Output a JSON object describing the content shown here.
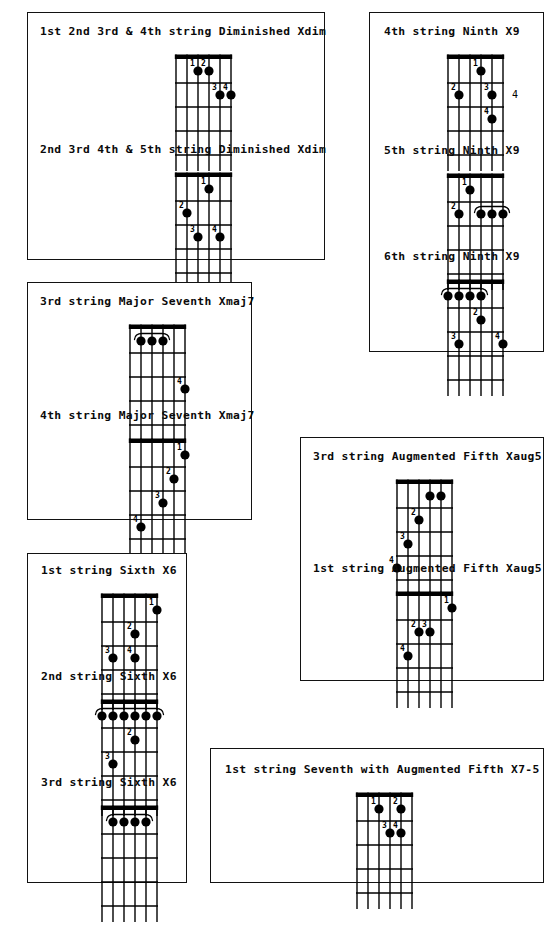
{
  "document": {
    "kind": "guitar-chord-diagram-sheet",
    "background_color": "#ffffff",
    "ink_color": "#000000"
  },
  "legend": {
    "finger_numbers": [
      "1",
      "2",
      "3",
      "4"
    ],
    "fret_marker_label": "4",
    "strings": 6,
    "frets": 5
  },
  "panels": [
    {
      "id": "panel-diminished",
      "x": 27,
      "y": 12,
      "w": 298,
      "h": 248,
      "chords": [
        {
          "id": "chord-dim-1234",
          "title": "1st 2nd 3rd & 4th string Diminished Xdim",
          "title_x": 12,
          "title_y": 12,
          "board_x": 132,
          "board_y": 34,
          "dots": [
            {
              "string": 4,
              "fret": 1,
              "finger": "1"
            },
            {
              "string": 3,
              "fret": 1,
              "finger": "2"
            },
            {
              "string": 2,
              "fret": 2,
              "finger": "3"
            },
            {
              "string": 1,
              "fret": 2,
              "finger": "4"
            }
          ],
          "barres": [],
          "fret_label": ""
        },
        {
          "id": "chord-dim-2345",
          "title": "2nd 3rd 4th & 5th string Diminished Xdim",
          "title_x": 12,
          "title_y": 130,
          "board_x": 132,
          "board_y": 152,
          "dots": [
            {
              "string": 3,
              "fret": 1,
              "finger": "1"
            },
            {
              "string": 5,
              "fret": 2,
              "finger": "2"
            },
            {
              "string": 4,
              "fret": 3,
              "finger": "3"
            },
            {
              "string": 2,
              "fret": 3,
              "finger": "4"
            }
          ],
          "barres": [],
          "fret_label": ""
        }
      ]
    },
    {
      "id": "panel-ninth",
      "x": 369,
      "y": 12,
      "w": 175,
      "h": 340,
      "chords": [
        {
          "id": "chord-ninth-4th",
          "title": "4th string Ninth X9",
          "title_x": 14,
          "title_y": 12,
          "board_x": 62,
          "board_y": 34,
          "dots": [
            {
              "string": 3,
              "fret": 1,
              "finger": "1"
            },
            {
              "string": 5,
              "fret": 2,
              "finger": "2"
            },
            {
              "string": 2,
              "fret": 2,
              "finger": "3"
            },
            {
              "string": 2,
              "fret": 3,
              "finger": "4"
            }
          ],
          "barres": [],
          "fret_label": "4",
          "fret_label_string": 2,
          "fret_label_fret": 2
        },
        {
          "id": "chord-ninth-5th",
          "title": "5th string Ninth X9",
          "title_x": 14,
          "title_y": 131,
          "board_x": 62,
          "board_y": 153,
          "dots": [
            {
              "string": 4,
              "fret": 1,
              "finger": "1"
            },
            {
              "string": 5,
              "fret": 2,
              "finger": "2"
            }
          ],
          "barres": [
            {
              "fret": 2,
              "from_string": 3,
              "to_string": 1,
              "finger": ""
            }
          ],
          "fret_label": ""
        },
        {
          "id": "chord-ninth-6th",
          "title": "6th string Ninth X9",
          "title_x": 14,
          "title_y": 237,
          "board_x": 62,
          "board_y": 259,
          "dots": [
            {
              "string": 3,
              "fret": 2,
              "finger": "2"
            },
            {
              "string": 5,
              "fret": 3,
              "finger": "3"
            },
            {
              "string": 1,
              "fret": 3,
              "finger": "4"
            }
          ],
          "barres": [
            {
              "fret": 1,
              "from_string": 6,
              "to_string": 3,
              "finger": ""
            }
          ],
          "fret_label": ""
        }
      ]
    },
    {
      "id": "panel-major-seventh",
      "x": 27,
      "y": 282,
      "w": 225,
      "h": 238,
      "chords": [
        {
          "id": "chord-maj7-3rd",
          "title": "3rd string Major Seventh Xmaj7",
          "title_x": 12,
          "title_y": 12,
          "board_x": 86,
          "board_y": 34,
          "dots": [
            {
              "string": 1,
              "fret": 3,
              "finger": "4"
            }
          ],
          "barres": [
            {
              "fret": 1,
              "from_string": 5,
              "to_string": 3,
              "finger": ""
            }
          ],
          "fret_label": ""
        },
        {
          "id": "chord-maj7-4th",
          "title": "4th string Major Seventh Xmaj7",
          "title_x": 12,
          "title_y": 126,
          "board_x": 86,
          "board_y": 148,
          "dots": [
            {
              "string": 1,
              "fret": 1,
              "finger": "1"
            },
            {
              "string": 2,
              "fret": 2,
              "finger": "2"
            },
            {
              "string": 3,
              "fret": 3,
              "finger": "3"
            },
            {
              "string": 5,
              "fret": 4,
              "finger": "4"
            }
          ],
          "barres": [],
          "fret_label": ""
        }
      ]
    },
    {
      "id": "panel-sixth",
      "x": 27,
      "y": 553,
      "w": 160,
      "h": 330,
      "chords": [
        {
          "id": "chord-sixth-1st",
          "title": "1st string Sixth X6",
          "title_x": 13,
          "title_y": 10,
          "board_x": 58,
          "board_y": 32,
          "dots": [
            {
              "string": 1,
              "fret": 1,
              "finger": "1"
            },
            {
              "string": 3,
              "fret": 2,
              "finger": "2"
            },
            {
              "string": 5,
              "fret": 3,
              "finger": "3"
            },
            {
              "string": 3,
              "fret": 3,
              "finger": "4"
            }
          ],
          "barres": [],
          "fret_label": ""
        },
        {
          "id": "chord-sixth-2nd",
          "title": "2nd string Sixth X6",
          "title_x": 13,
          "title_y": 116,
          "board_x": 58,
          "board_y": 138,
          "dots": [
            {
              "string": 3,
              "fret": 2,
              "finger": "2"
            },
            {
              "string": 5,
              "fret": 3,
              "finger": "3"
            }
          ],
          "barres": [
            {
              "fret": 1,
              "from_string": 6,
              "to_string": 1,
              "finger": ""
            }
          ],
          "fret_label": ""
        },
        {
          "id": "chord-sixth-3rd",
          "title": "3rd string Sixth X6",
          "title_x": 13,
          "title_y": 222,
          "board_x": 58,
          "board_y": 244,
          "dots": [],
          "barres": [
            {
              "fret": 1,
              "from_string": 5,
              "to_string": 2,
              "finger": ""
            }
          ],
          "fret_label": ""
        }
      ]
    },
    {
      "id": "panel-augmented-fifth",
      "x": 300,
      "y": 437,
      "w": 244,
      "h": 244,
      "chords": [
        {
          "id": "chord-aug5-3rd",
          "title": "3rd string Augmented Fifth Xaug5",
          "title_x": 12,
          "title_y": 12,
          "board_x": 80,
          "board_y": 34,
          "dots": [
            {
              "string": 3,
              "fret": 1,
              "finger": ""
            },
            {
              "string": 2,
              "fret": 1,
              "finger": ""
            },
            {
              "string": 4,
              "fret": 2,
              "finger": "2"
            },
            {
              "string": 5,
              "fret": 3,
              "finger": "3"
            },
            {
              "string": 6,
              "fret": 4,
              "finger": "4"
            }
          ],
          "barres": [],
          "fret_label": ""
        },
        {
          "id": "chord-aug5-1st",
          "title": "1st string Augmented Fifth Xaug5",
          "title_x": 12,
          "title_y": 124,
          "board_x": 80,
          "board_y": 146,
          "dots": [
            {
              "string": 1,
              "fret": 1,
              "finger": "1"
            },
            {
              "string": 4,
              "fret": 2,
              "finger": "2"
            },
            {
              "string": 3,
              "fret": 2,
              "finger": "3"
            },
            {
              "string": 5,
              "fret": 3,
              "finger": "4"
            }
          ],
          "barres": [],
          "fret_label": ""
        }
      ]
    },
    {
      "id": "panel-seventh-aug5",
      "x": 210,
      "y": 748,
      "w": 334,
      "h": 135,
      "chords": [
        {
          "id": "chord-7aug5-1st",
          "title": "1st string Seventh with Augmented Fifth X7-5",
          "title_x": 14,
          "title_y": 14,
          "board_x": 130,
          "board_y": 36,
          "dots": [
            {
              "string": 4,
              "fret": 1,
              "finger": "1"
            },
            {
              "string": 2,
              "fret": 1,
              "finger": "2"
            },
            {
              "string": 3,
              "fret": 2,
              "finger": "3"
            },
            {
              "string": 2,
              "fret": 2,
              "finger": "4"
            }
          ],
          "barres": [],
          "fret_label": ""
        }
      ]
    }
  ]
}
